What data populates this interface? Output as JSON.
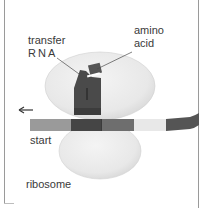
{
  "diagram": {
    "labels": {
      "transfer_rna_line1": "transfer",
      "transfer_rna_line2": "RNA",
      "amino_acid_line1": "amino",
      "amino_acid_line2": "acid",
      "start": "start",
      "ribosome": "ribosome",
      "trna_number": "1"
    },
    "direction_arrow": "left-arrow-icon",
    "mrna_segments": [
      {
        "name": "start-codon",
        "color": "#9a9a9a"
      },
      {
        "name": "codon-1",
        "color": "#454545"
      },
      {
        "name": "codon-2",
        "color": "#6e6e6e"
      },
      {
        "name": "codon-3",
        "color": "#e8e8e8"
      },
      {
        "name": "codon-4",
        "color": "#555555"
      }
    ],
    "colors": {
      "ribosome_fill": "#e9e9e9",
      "ribosome_edge": "#cfcfcf",
      "trna_fill": "#4a4a4a",
      "amino_acid_fill": "#555555",
      "text": "#3a3a3a"
    }
  }
}
